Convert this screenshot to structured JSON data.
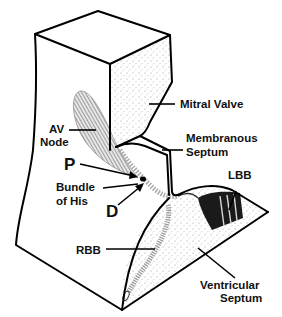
{
  "labels": {
    "mitral_valve": "Mitral Valve",
    "av_node_line1": "AV",
    "av_node_line2": "Node",
    "membranous_septum_line1": "Membranous",
    "membranous_septum_line2": "Septum",
    "proximal": "P",
    "bundle_of_his_line1": "Bundle",
    "bundle_of_his_line2": "of His",
    "distal": "D",
    "lbb": "LBB",
    "rbb": "RBB",
    "ventricular_septum_line1": "Ventricular",
    "ventricular_septum_line2": "Septum"
  },
  "colors": {
    "line": "#000000",
    "stipple": "#bdbdbd",
    "node_hatch": "#8a8a8a",
    "lbb_fill": "#1a1a1a",
    "background": "#ffffff"
  }
}
